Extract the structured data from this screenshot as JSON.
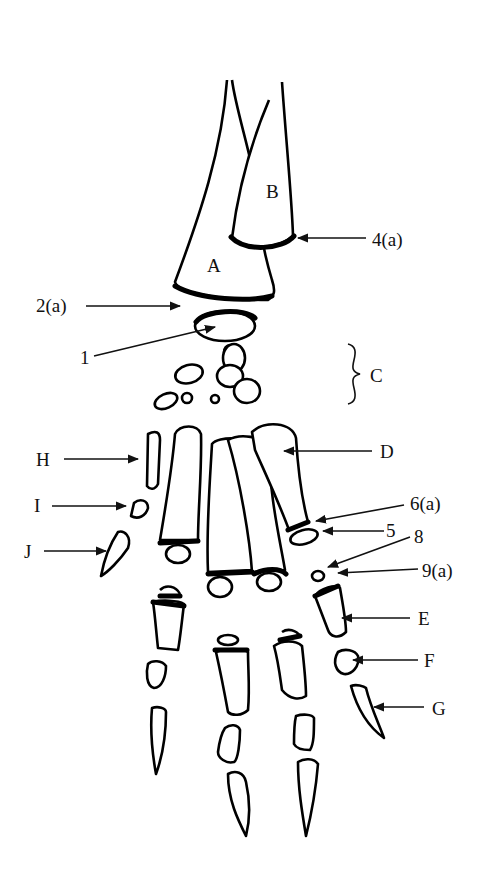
{
  "figure": {
    "type": "anatomical line drawing",
    "background": "#ffffff",
    "ink": "#000000"
  },
  "labels": {
    "A": "A",
    "B": "B",
    "C": "C",
    "D": "D",
    "E": "E",
    "F": "F",
    "G": "G",
    "H": "H",
    "I": "I",
    "J": "J",
    "n1": "1",
    "n2a": "2(a)",
    "n4a": "4(a)",
    "n5": "5",
    "n6a": "6(a)",
    "n8": "8",
    "n9a": "9(a)"
  }
}
